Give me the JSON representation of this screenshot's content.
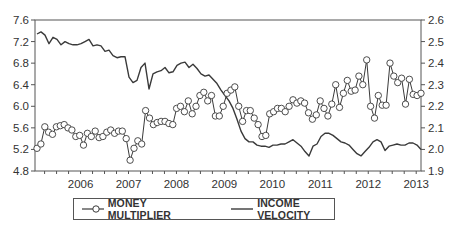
{
  "chart_data": {
    "type": "line",
    "title": "",
    "xlabel": "",
    "ylabel_left": "",
    "ylabel_right": "",
    "x_start": 2005.55,
    "x_end": 2013.6,
    "x_ticks": [
      "2006",
      "2007",
      "2008",
      "2009",
      "2010",
      "2011",
      "2012",
      "2013"
    ],
    "y_left": {
      "min": 4.8,
      "max": 7.6,
      "ticks": [
        "4.8",
        "5.2",
        "5.6",
        "6.0",
        "6.4",
        "6.8",
        "7.2",
        "7.6"
      ]
    },
    "y_right": {
      "min": 1.9,
      "max": 2.6,
      "ticks": [
        "1.9",
        "2.0",
        "2.1",
        "2.2",
        "2.3",
        "2.4",
        "2.5",
        "2.6"
      ]
    },
    "grid": false,
    "legend_position": "bottom",
    "series": [
      {
        "name": "MONEY MULTIPLIER",
        "axis": "left",
        "marker": "circle",
        "values": [
          5.22,
          5.3,
          5.62,
          5.52,
          5.48,
          5.62,
          5.64,
          5.66,
          5.6,
          5.56,
          5.44,
          5.46,
          5.28,
          5.5,
          5.44,
          5.54,
          5.42,
          5.44,
          5.52,
          5.56,
          5.5,
          5.54,
          5.54,
          5.4,
          5.0,
          5.22,
          5.36,
          5.3,
          5.92,
          5.78,
          5.66,
          5.7,
          5.72,
          5.72,
          5.68,
          5.66,
          5.96,
          6.0,
          5.9,
          6.1,
          5.86,
          6.0,
          6.2,
          6.26,
          6.1,
          6.2,
          5.82,
          5.82,
          6.0,
          6.24,
          6.3,
          6.36,
          6.0,
          5.72,
          5.92,
          5.92,
          5.78,
          5.66,
          5.44,
          5.46,
          5.86,
          5.9,
          5.96,
          5.96,
          5.9,
          6.0,
          6.12,
          6.06,
          6.1,
          6.06,
          5.88,
          5.76,
          5.84,
          6.1,
          5.96,
          5.82,
          6.04,
          6.4,
          5.98,
          6.24,
          6.48,
          6.28,
          6.3,
          6.56,
          6.4,
          6.86,
          6.0,
          5.78,
          6.2,
          6.02,
          6.02,
          6.8,
          6.56,
          6.44,
          6.52,
          6.04,
          6.5,
          6.22,
          6.2,
          6.24
        ]
      },
      {
        "name": "INCOME VELOCITY",
        "axis": "left",
        "marker": "none",
        "values": [
          7.34,
          7.38,
          7.32,
          7.16,
          7.28,
          7.24,
          7.14,
          7.2,
          7.16,
          7.14,
          7.14,
          7.16,
          7.2,
          7.24,
          7.12,
          7.14,
          7.12,
          7.02,
          7.04,
          6.94,
          6.9,
          6.92,
          6.92,
          6.54,
          6.44,
          6.48,
          6.72,
          6.8,
          6.32,
          6.6,
          6.64,
          6.66,
          6.72,
          6.62,
          6.64,
          6.76,
          6.8,
          6.82,
          6.72,
          6.78,
          6.7,
          6.6,
          6.56,
          6.58,
          6.5,
          6.42,
          6.3,
          6.2,
          6.1,
          5.96,
          5.76,
          5.54,
          5.4,
          5.34,
          5.34,
          5.28,
          5.26,
          5.26,
          5.24,
          5.28,
          5.28,
          5.3,
          5.3,
          5.34,
          5.38,
          5.32,
          5.26,
          5.16,
          5.08,
          5.26,
          5.3,
          5.44,
          5.5,
          5.5,
          5.46,
          5.4,
          5.34,
          5.32,
          5.28,
          5.2,
          5.12,
          5.08,
          5.16,
          5.24,
          5.34,
          5.38,
          5.34,
          5.18,
          5.26,
          5.28,
          5.3,
          5.28,
          5.28,
          5.32,
          5.32,
          5.28,
          5.2
        ]
      }
    ]
  },
  "legend": {
    "items": [
      {
        "label": "MONEY MULTIPLIER",
        "symbol": "line-with-circle"
      },
      {
        "label": "INCOME VELOCITY",
        "symbol": "line"
      }
    ]
  },
  "colors": {
    "line": "#3a3a3a",
    "marker_fill": "#ffffff",
    "axis": "#555555",
    "text": "#333333"
  }
}
